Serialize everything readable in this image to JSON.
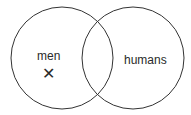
{
  "diagram": {
    "type": "venn",
    "sets": [
      {
        "label": "men"
      },
      {
        "label": "humans"
      }
    ],
    "marker": {
      "symbol": "✕",
      "region": "men only"
    },
    "colors": {
      "stroke": "#333333",
      "text": "#2a2a2a"
    }
  }
}
